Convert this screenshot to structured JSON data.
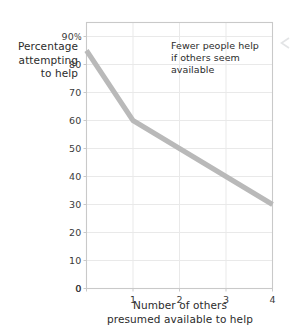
{
  "chart_data": {
    "type": "line",
    "title": "",
    "subtitle": "",
    "xlabel": "Number of others\npresumed available to help",
    "ylabel": "Percentage\nattempting\nto help",
    "x": [
      0,
      1,
      2,
      3,
      4
    ],
    "values": [
      85,
      60,
      50,
      40,
      30
    ],
    "series": [
      {
        "name": "Percentage attempting to help",
        "values": [
          85,
          60,
          50,
          40,
          30
        ]
      }
    ],
    "xlim": [
      0,
      4
    ],
    "ylim": [
      0,
      95
    ],
    "xticks": [
      "0",
      "1",
      "2",
      "3",
      "4"
    ],
    "yticks": [
      "0",
      "10",
      "20",
      "30",
      "40",
      "50",
      "60",
      "70",
      "80",
      "90%"
    ],
    "ytick_values": [
      0,
      10,
      20,
      30,
      40,
      50,
      60,
      70,
      80,
      90
    ],
    "xtick_values": [
      0,
      1,
      2,
      3,
      4
    ],
    "grid": true,
    "grid_axis": "both",
    "legend": false,
    "legend_position": "none",
    "annotations": [
      {
        "text": "Fewer people help\nif others seem\navailable",
        "x": 1.6,
        "y": 90
      }
    ],
    "line_color": "#b9b9b9",
    "line_width_px": 5,
    "grid_color": "#e9e9e9",
    "axis_color": "#c9c9c9",
    "background": "#ffffff",
    "text_color": "#2b2b2b"
  },
  "axes": {
    "y_label_text": "Percentage\nattempting\nto help",
    "x_label_text": "Number of others\npresumed available to help",
    "y_ticks": [
      {
        "label": "90",
        "suffix": "%",
        "value": 90
      },
      {
        "label": "80",
        "suffix": "",
        "value": 80
      },
      {
        "label": "70",
        "suffix": "",
        "value": 70
      },
      {
        "label": "60",
        "suffix": "",
        "value": 60
      },
      {
        "label": "50",
        "suffix": "",
        "value": 50
      },
      {
        "label": "40",
        "suffix": "",
        "value": 40
      },
      {
        "label": "30",
        "suffix": "",
        "value": 30
      },
      {
        "label": "20",
        "suffix": "",
        "value": 20
      },
      {
        "label": "10",
        "suffix": "",
        "value": 10
      },
      {
        "label": "0",
        "suffix": "",
        "value": 0
      }
    ],
    "x_ticks": [
      {
        "label": "0",
        "value": 0
      },
      {
        "label": "1",
        "value": 1
      },
      {
        "label": "2",
        "value": 2
      },
      {
        "label": "3",
        "value": 3
      },
      {
        "label": "4",
        "value": 4
      }
    ]
  },
  "annotation": {
    "text": "Fewer people help\nif others seem\navailable"
  },
  "icons": {
    "edge_artifact": "chevron-left-icon"
  }
}
